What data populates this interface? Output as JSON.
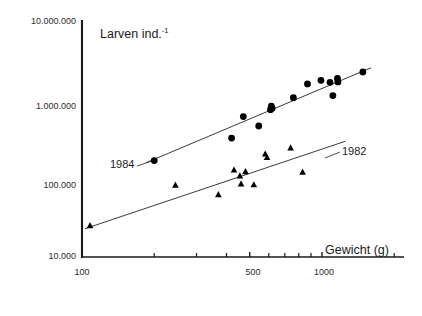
{
  "chart_data": {
    "type": "scatter",
    "title": "",
    "xlabel": "Gewicht (g)",
    "ylabel": "Larven ind.",
    "ylabel_superscript": "-1",
    "x_scale": "log",
    "y_scale": "log",
    "xlim": [
      100,
      2000
    ],
    "ylim": [
      10000,
      10000000
    ],
    "grid": false,
    "legend_position": "inline-annotations",
    "x_tick_labels": [
      "100",
      "500",
      "1000"
    ],
    "x_tick_values": [
      100,
      500,
      1000
    ],
    "x_minor_ticks": [
      200,
      300,
      400,
      600,
      700,
      800,
      900,
      2000
    ],
    "y_tick_labels": [
      "10.000.000",
      "1.000.000",
      "100.000",
      "10.000"
    ],
    "y_tick_values": [
      10000000,
      1000000,
      100000,
      10000
    ],
    "annotations": [
      {
        "text": "1984",
        "series": "1984"
      },
      {
        "text": "1982",
        "series": "1982"
      }
    ],
    "series": [
      {
        "name": "1984",
        "marker": "circle",
        "color": "#000000",
        "points": [
          {
            "x": 200,
            "y": 170000
          },
          {
            "x": 420,
            "y": 330000
          },
          {
            "x": 470,
            "y": 620000
          },
          {
            "x": 545,
            "y": 470000
          },
          {
            "x": 610,
            "y": 760000
          },
          {
            "x": 615,
            "y": 840000
          },
          {
            "x": 620,
            "y": 790000
          },
          {
            "x": 760,
            "y": 1080000
          },
          {
            "x": 870,
            "y": 1620000
          },
          {
            "x": 990,
            "y": 1800000
          },
          {
            "x": 1080,
            "y": 1700000
          },
          {
            "x": 1110,
            "y": 1150000
          },
          {
            "x": 1160,
            "y": 1900000
          },
          {
            "x": 1165,
            "y": 1720000
          },
          {
            "x": 1480,
            "y": 2300000
          }
        ]
      },
      {
        "name": "1982",
        "marker": "triangle",
        "color": "#000000",
        "points": [
          {
            "x": 108,
            "y": 25000
          },
          {
            "x": 245,
            "y": 82000
          },
          {
            "x": 370,
            "y": 62000
          },
          {
            "x": 430,
            "y": 128000
          },
          {
            "x": 455,
            "y": 108000
          },
          {
            "x": 460,
            "y": 85000
          },
          {
            "x": 480,
            "y": 122000
          },
          {
            "x": 520,
            "y": 83000
          },
          {
            "x": 580,
            "y": 205000
          },
          {
            "x": 590,
            "y": 185000
          },
          {
            "x": 740,
            "y": 245000
          },
          {
            "x": 830,
            "y": 120000
          }
        ]
      }
    ],
    "fit_lines": [
      {
        "series": "1984",
        "x_start": 185,
        "y_start": 160000,
        "x_end": 1600,
        "y_end": 2600000
      },
      {
        "series": "1982",
        "x_start": 103,
        "y_start": 23000,
        "x_end": 1250,
        "y_end": 300000
      }
    ]
  },
  "axis": {
    "x_title": "Gewicht (g)",
    "y_title_base": "Larven ind.",
    "y_title_sup": "-1"
  },
  "labels": {
    "y0": "10.000.000",
    "y1": "1.000.000",
    "y2": "100.000",
    "y3": "10.000",
    "x0": "100",
    "x1": "500",
    "x2": "1000",
    "series_1984": "1984",
    "series_1982": "1982"
  }
}
